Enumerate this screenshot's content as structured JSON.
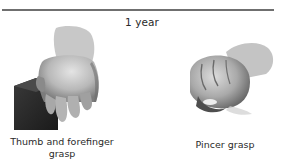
{
  "header": {
    "age_label": "1 year"
  },
  "figures": [
    {
      "id": "thumb-forefinger",
      "caption": "Thumb and forefinger grasp",
      "icon": "hand-holding-block-illustration"
    },
    {
      "id": "pincer",
      "caption": "Pincer grasp",
      "icon": "hand-pincer-illustration"
    }
  ],
  "colors": {
    "rule": "#6f6f6f",
    "text": "#2a2a2a",
    "block": "#2b2b2b",
    "skin_light": "#d6d6d6",
    "skin_shadow": "#7a7a7a"
  }
}
